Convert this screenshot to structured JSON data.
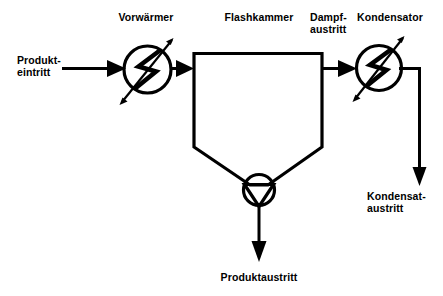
{
  "diagram": {
    "background_color": "#ffffff",
    "line_color": "#000000",
    "labels": {
      "preheater": "Vorwärmer",
      "flash_chamber": "Flashkammer",
      "vapor_outlet_line1": "Dampf-",
      "vapor_outlet_line2": "austritt",
      "condenser": "Kondensator",
      "product_inlet_line1": "Produkt-",
      "product_inlet_line2": "eintritt",
      "condensate_outlet_line1": "Kondensat-",
      "condensate_outlet_line2": "austritt",
      "product_outlet": "Produktaustritt"
    },
    "components": [
      {
        "id": "preheater",
        "type": "heat-exchanger",
        "label": "Vorwärmer"
      },
      {
        "id": "flash-chamber",
        "type": "vessel",
        "label": "Flashkammer"
      },
      {
        "id": "condenser",
        "type": "heat-exchanger",
        "label": "Kondensator"
      },
      {
        "id": "pump",
        "type": "pump",
        "label": ""
      }
    ],
    "streams": [
      {
        "id": "product-inlet",
        "label": "Produkteintritt",
        "from": "",
        "to": "preheater"
      },
      {
        "id": "preheater-to-chamber",
        "label": "",
        "from": "preheater",
        "to": "flash-chamber"
      },
      {
        "id": "vapor-outlet",
        "label": "Dampfaustritt",
        "from": "flash-chamber",
        "to": "condenser"
      },
      {
        "id": "condensate-outlet",
        "label": "Kondensataustritt",
        "from": "condenser",
        "to": ""
      },
      {
        "id": "product-outlet",
        "label": "Produktaustritt",
        "from": "pump",
        "to": ""
      }
    ]
  }
}
